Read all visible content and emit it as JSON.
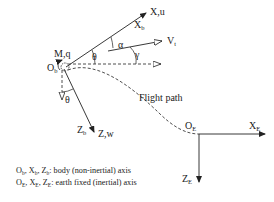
{
  "diagram": {
    "type": "aircraft coordinate frames",
    "body_frame": {
      "origin": {
        "main": "O",
        "sub": "b"
      },
      "moment_label": "M,q",
      "x_axis_label": "X,u",
      "xb_label": {
        "main": "X",
        "sub": "b"
      },
      "z_axis_label": "Z,w",
      "zb_label": {
        "main": "Z",
        "sub": "b"
      }
    },
    "velocity_label": {
      "main": "V",
      "sub": "t"
    },
    "angles": {
      "theta_upper": "θ",
      "theta_lower": "θ",
      "alpha": "α",
      "gamma": "γ"
    },
    "flight_path_label": "Flight path",
    "earth_frame": {
      "origin": {
        "main": "O",
        "sub": "E"
      },
      "x_label": {
        "main": "X",
        "sub": "E"
      },
      "z_label": {
        "main": "Z",
        "sub": "E"
      }
    },
    "legend": [
      {
        "symbols": [
          {
            "main": "O",
            "sub": "b"
          },
          {
            "main": "X",
            "sub": "b"
          },
          {
            "main": "Z",
            "sub": "b"
          }
        ],
        "text": ": body (non-inertial) axis"
      },
      {
        "symbols": [
          {
            "main": "O",
            "sub": "E"
          },
          {
            "main": "X",
            "sub": "E"
          },
          {
            "main": "Z",
            "sub": "E"
          }
        ],
        "text": ": earth fixed (inertial) axis"
      }
    ]
  }
}
